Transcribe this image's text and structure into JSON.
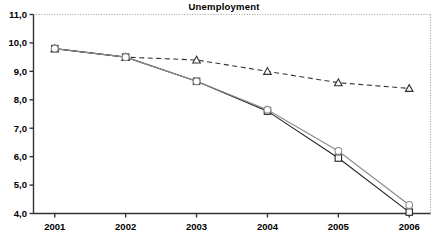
{
  "chart_data": {
    "type": "line",
    "title": "Unemployment",
    "xlabel": "",
    "ylabel": "",
    "categories": [
      "2001",
      "2002",
      "2003",
      "2004",
      "2005",
      "2006"
    ],
    "x": [
      2001,
      2002,
      2003,
      2004,
      2005,
      2006
    ],
    "ylim": [
      4.0,
      11.0
    ],
    "xlim": [
      2000.7,
      2006.3
    ],
    "ytick_labels": [
      "11,0",
      "10,0",
      "9,0",
      "8,0",
      "7,0",
      "6,0",
      "5,0",
      "4,0"
    ],
    "ytick_values": [
      11.0,
      10.0,
      9.0,
      8.0,
      7.0,
      6.0,
      5.0,
      4.0
    ],
    "xtick_labels": [
      "2001",
      "2002",
      "2003",
      "2004",
      "2005",
      "2006"
    ],
    "grid": false,
    "legend": "none",
    "series": [
      {
        "name": "dashed-triangle-series",
        "marker": "triangle",
        "linestyle": "dashed",
        "color": "#333333",
        "values": [
          9.8,
          9.5,
          9.4,
          9.0,
          8.6,
          8.4
        ]
      },
      {
        "name": "solid-square-series",
        "marker": "square",
        "linestyle": "solid",
        "color": "#222222",
        "values": [
          9.8,
          9.5,
          8.65,
          7.6,
          5.95,
          4.05
        ]
      },
      {
        "name": "solid-circle-series",
        "marker": "circle",
        "linestyle": "solid",
        "color": "#8a8a8a",
        "values": [
          9.8,
          9.5,
          8.65,
          7.65,
          6.2,
          4.3
        ]
      }
    ]
  },
  "axes": {
    "top_border_style": "dotted",
    "right_border_style": "dotted",
    "left_border_style": "solid",
    "bottom_border_style": "solid"
  },
  "colors": {
    "axis": "#333333",
    "frame_dotted": "#999999",
    "series_primary": "#222222",
    "series_secondary": "#8a8a8a",
    "background": "#ffffff"
  }
}
